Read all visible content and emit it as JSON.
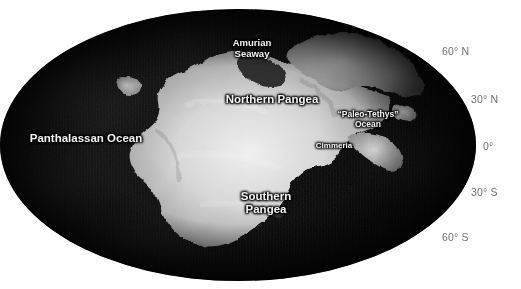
{
  "map": {
    "title": "Paleogeographic Mollweide globe",
    "projection": "mollweide",
    "background_color": "#ffffff",
    "ocean_color": "#070707",
    "land_color": "#d8d8d8",
    "label_color": "#f2f2f2",
    "graticule_label_color": "#6e6e6e",
    "feature_labels": [
      {
        "name": "panthalassan-ocean",
        "text": "Panthalassan Ocean"
      },
      {
        "name": "amurian-seaway",
        "text": "Amurian\nSeaway"
      },
      {
        "name": "northern-pangea",
        "text": "Northern Pangea"
      },
      {
        "name": "paleo-tethys-ocean",
        "text": "“Paleo-Tethys”\nOcean"
      },
      {
        "name": "cimmeria",
        "text": "Cimmeria"
      },
      {
        "name": "southern-pangea",
        "text": "Southern\nPangea"
      }
    ],
    "latitude_labels": [
      {
        "name": "lat-60-north",
        "text": "60° N",
        "value": 60
      },
      {
        "name": "lat-30-north",
        "text": "30° N",
        "value": 30
      },
      {
        "name": "lat-equator",
        "text": "0°",
        "value": 0
      },
      {
        "name": "lat-30-south",
        "text": "30° S",
        "value": -30
      },
      {
        "name": "lat-60-south",
        "text": "60° S",
        "value": -60
      }
    ]
  }
}
